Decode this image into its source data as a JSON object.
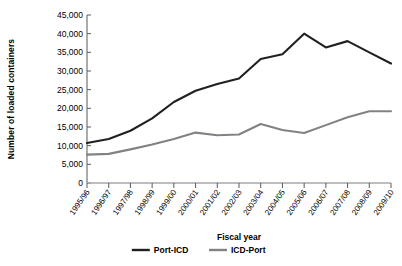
{
  "chart_data": {
    "type": "line",
    "title": "",
    "xlabel": "Fiscal year",
    "ylabel": "Number of loaded containers",
    "categories": [
      "1995/96",
      "1996/97",
      "1997/98",
      "1998/99",
      "1999/00",
      "2000/01",
      "2001/02",
      "2002/03",
      "2003/04",
      "2004/05",
      "2005/06",
      "2006/07",
      "2007/08",
      "2008/09",
      "2009/10"
    ],
    "series": [
      {
        "name": "Port-ICD",
        "color": "#231f20",
        "values": [
          10700,
          11800,
          14000,
          17300,
          21700,
          24700,
          26500,
          28000,
          33200,
          34500,
          40000,
          36300,
          38000,
          35000,
          32000
        ]
      },
      {
        "name": "ICD-Port",
        "color": "#808285",
        "values": [
          7600,
          7800,
          9000,
          10300,
          11800,
          13500,
          12800,
          13000,
          15800,
          14200,
          13400,
          15500,
          17600,
          19200,
          19200
        ]
      }
    ],
    "ylim": [
      0,
      45000
    ],
    "yticks": [
      0,
      5000,
      10000,
      15000,
      20000,
      25000,
      30000,
      35000,
      40000,
      45000
    ],
    "ytick_labels": [
      "0",
      "5,000",
      "10,000",
      "15,000",
      "20,000",
      "25,000",
      "30,000",
      "35,000",
      "40,000",
      "45,000"
    ],
    "grid": false,
    "legend_position": "bottom"
  },
  "legend": {
    "items": [
      {
        "label": "Port-ICD",
        "color": "#231f20"
      },
      {
        "label": "ICD-Port",
        "color": "#808285"
      }
    ]
  },
  "axes": {
    "x_title": "Fiscal year",
    "y_title": "Number of loaded containers"
  }
}
